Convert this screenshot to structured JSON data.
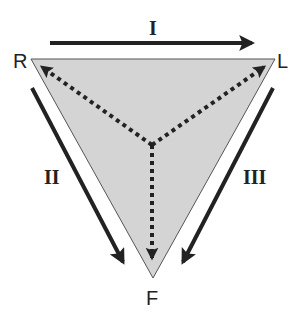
{
  "diagram": {
    "vertices": {
      "top_left": "R",
      "top_right": "L",
      "bottom": "F"
    },
    "transitions": {
      "top": "I",
      "left": "II",
      "right": "III"
    },
    "colors": {
      "triangle_fill": "#d4d4d4",
      "triangle_stroke": "#555555",
      "arrow": "#222222"
    }
  }
}
